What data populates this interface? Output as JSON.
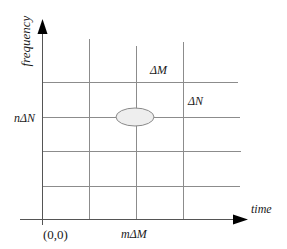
{
  "diagram": {
    "type": "time-frequency grid",
    "axes": {
      "y_label": "frequency",
      "x_label": "time",
      "origin_label": "(0,0)"
    },
    "tick_labels": {
      "y_tick": "nΔN",
      "x_tick": "mΔM"
    },
    "cell_labels": {
      "time_step": "ΔM",
      "freq_step": "ΔN"
    },
    "grid": {
      "vertical_lines_x": [
        89,
        136,
        183
      ],
      "horizontal_lines_y": [
        82,
        117,
        151,
        186
      ]
    },
    "highlight": {
      "shape": "ellipse",
      "center": [
        135,
        117
      ],
      "fill": "#eeeeee",
      "stroke": "#8a8a8a"
    },
    "colors": {
      "axis": "#000000",
      "grid": "#8c8c8c",
      "text": "#1a1a1a"
    }
  }
}
